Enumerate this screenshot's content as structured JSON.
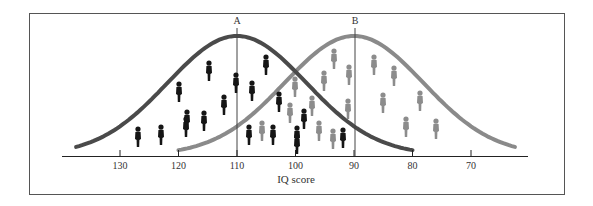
{
  "chart_data": {
    "type": "area",
    "title": "",
    "xlabel": "IQ score",
    "ylabel": "",
    "x_reversed": true,
    "xlim": [
      137,
      62
    ],
    "xticks": [
      130,
      120,
      110,
      100,
      90,
      80,
      70
    ],
    "xtick_labels": [
      "130",
      "120",
      "110",
      "100",
      "90",
      "80",
      "70"
    ],
    "grid": false,
    "legend": null,
    "markers": [
      {
        "label": "A",
        "x": 110
      },
      {
        "label": "B",
        "x": 90
      }
    ],
    "series": [
      {
        "name": "Population A",
        "type": "normal-curve",
        "mean": 110,
        "color": "#4a4a4a",
        "figure_color": "#111111",
        "figure_count": 19
      },
      {
        "name": "Population B",
        "type": "normal-curve",
        "mean": 90,
        "color": "#8a8a8a",
        "figure_color": "#8c8c8c",
        "figure_count": 19
      }
    ],
    "annotations": [
      "A",
      "B"
    ]
  },
  "labels": {
    "axis_title": "IQ score",
    "marker_a": "A",
    "marker_b": "B",
    "ticks": [
      "130",
      "120",
      "110",
      "100",
      "90",
      "80",
      "70"
    ]
  },
  "colors": {
    "curve_a": "#4a4a4a",
    "curve_b": "#8a8a8a",
    "figure_a": "#151515",
    "figure_b": "#8c8c8c",
    "frame": "#555555",
    "axis": "#222222"
  }
}
